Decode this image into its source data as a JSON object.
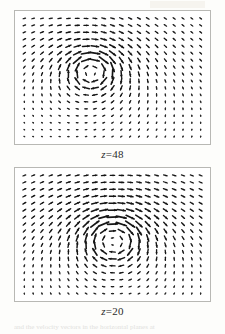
{
  "figure": {
    "name": "velocity-vector-field-panels",
    "caption_fragment": "and the velocity vectors in the horizontal planes at",
    "panels": [
      {
        "id": "panel-z48",
        "label_variable": "z",
        "label_equals": "=",
        "label_value": "48",
        "label_full": "z=48"
      },
      {
        "id": "panel-z20",
        "label_variable": "z",
        "label_equals": "=",
        "label_value": "20",
        "label_full": "z=20"
      }
    ]
  },
  "chart_data": [
    {
      "type": "quiver",
      "title": "z=48",
      "xlabel": "",
      "ylabel": "",
      "grid": false,
      "legend": null,
      "nx": 21,
      "ny": 18,
      "xlim": [
        0,
        21
      ],
      "ylim": [
        0,
        18
      ],
      "description": "Horizontal-plane velocity vector field at z=48 showing a counter-clockwise vortex whose core sits left of centre in the upper half of the plane, with strong downward flow along the left edge and upward flow on the right.",
      "vortex": {
        "center_x": 8.2,
        "center_y": 8.0,
        "rotation": "counter-clockwise",
        "strength": 1.0,
        "core_radius": 2.1
      },
      "background_flow": {
        "u": 0.1,
        "v": 0.04
      },
      "max_arrow_length": 1.0
    },
    {
      "type": "quiver",
      "title": "z=20",
      "xlabel": "",
      "ylabel": "",
      "grid": false,
      "legend": null,
      "nx": 21,
      "ny": 18,
      "xlim": [
        0,
        21
      ],
      "ylim": [
        0,
        18
      ],
      "description": "Horizontal-plane velocity vector field at z=20 showing a broader counter-clockwise vortex centred slightly right of centre and lower in the plane, with strong rightward flow across the upper-middle band and converging flow near the bottom.",
      "vortex": {
        "center_x": 10.6,
        "center_y": 9.6,
        "rotation": "counter-clockwise",
        "strength": 1.05,
        "core_radius": 2.6
      },
      "background_flow": {
        "u": 0.16,
        "v": 0.0
      },
      "max_arrow_length": 1.0
    }
  ]
}
